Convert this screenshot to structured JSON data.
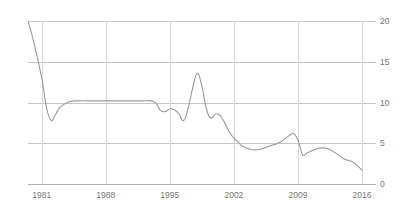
{
  "chart_data": {
    "type": "line",
    "title": "",
    "subtitle": "",
    "xlabel": "",
    "ylabel": "",
    "xlim": [
      1979.5,
      2016
    ],
    "ylim": [
      0,
      20
    ],
    "grid": true,
    "legend": false,
    "legend_position": "none",
    "line_color": "#9a9a9a",
    "grid_color": "#c8c8c8",
    "axis_color": "#b0b0b0",
    "label_color": "#777777",
    "x_ticks": [
      1981,
      1988,
      1995,
      2002,
      2009,
      2016
    ],
    "x_tick_labels": [
      "1981",
      "1988",
      "1995",
      "2002",
      "2009",
      "2016"
    ],
    "y_ticks": [
      0,
      5,
      10,
      15,
      20
    ],
    "y_tick_labels": [
      "0",
      "5",
      "10",
      "15",
      "20"
    ],
    "series": [
      {
        "name": "value",
        "x": [
          1979.5,
          1980,
          1981,
          1981.5,
          1982,
          1982.5,
          1983,
          1984,
          1985,
          1986,
          1987,
          1988,
          1989,
          1990,
          1991,
          1992,
          1993,
          1993.5,
          1994,
          1994.5,
          1995,
          1995.5,
          1996,
          1996.5,
          1997,
          1997.5,
          1998,
          1998.5,
          1999,
          1999.5,
          2000,
          2000.5,
          2001,
          2001.5,
          2002,
          2002.5,
          2003,
          2004,
          2005,
          2006,
          2007,
          2008,
          2008.5,
          2009,
          2009.5,
          2010,
          2011,
          2012,
          2013,
          2014,
          2015,
          2016
        ],
        "values": [
          19.9,
          18.0,
          13.0,
          9.5,
          7.8,
          8.5,
          9.4,
          10.1,
          10.2,
          10.2,
          10.2,
          10.2,
          10.2,
          10.2,
          10.2,
          10.2,
          10.2,
          9.9,
          9.0,
          8.9,
          9.2,
          9.1,
          8.6,
          7.8,
          9.3,
          11.8,
          13.6,
          12.0,
          9.2,
          8.1,
          8.6,
          8.4,
          7.5,
          6.4,
          5.6,
          5.1,
          4.6,
          4.2,
          4.3,
          4.7,
          5.1,
          5.9,
          6.2,
          5.4,
          3.6,
          3.8,
          4.3,
          4.4,
          3.9,
          3.1,
          2.7,
          1.7
        ]
      }
    ]
  },
  "axis": {
    "y_axis_name": "y-axis",
    "x_axis_name": "x-axis"
  }
}
